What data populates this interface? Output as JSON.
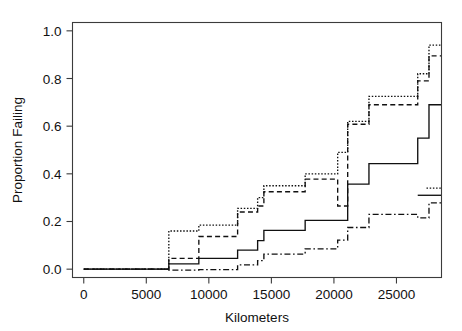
{
  "chart_data": {
    "type": "line",
    "title": "",
    "subtitle": "",
    "xlabel": "Kilometers",
    "ylabel": "Proportion Failing",
    "xlim": [
      -900,
      28600
    ],
    "ylim": [
      -0.035,
      1.035
    ],
    "xticks": [
      0,
      5000,
      10000,
      15000,
      20000,
      25000
    ],
    "xticklabels": [
      "0",
      "5000",
      "10000",
      "15000",
      "20000",
      "25000"
    ],
    "yticks": [
      0.0,
      0.2,
      0.4,
      0.6,
      0.8,
      1.0
    ],
    "yticklabels": [
      "0.0",
      "0.2",
      "0.4",
      "0.6",
      "0.8",
      "1.0"
    ],
    "grid": false,
    "legend": "none",
    "drawstyle": "steps-post",
    "series": [
      {
        "name": "series-1",
        "linestyle": "dotted",
        "x": [
          0,
          6800,
          9200,
          12300,
          13900,
          14400,
          17700,
          20300,
          21100,
          22800,
          26700,
          27600,
          28400
        ],
        "y": [
          0.0,
          0.16,
          0.185,
          0.255,
          0.3,
          0.35,
          0.4,
          0.49,
          0.62,
          0.725,
          0.82,
          0.94,
          0.94
        ]
      },
      {
        "name": "series-2",
        "linestyle": "dashed",
        "x": [
          0,
          6800,
          9200,
          12300,
          13900,
          14400,
          17700,
          20300,
          21100,
          22800,
          26700,
          27600,
          28400
        ],
        "y": [
          0.0,
          0.045,
          0.137,
          0.24,
          0.265,
          0.325,
          0.378,
          0.265,
          0.608,
          0.69,
          0.79,
          0.895,
          0.895
        ]
      },
      {
        "name": "series-3",
        "linestyle": "solid",
        "x": [
          0,
          6800,
          9200,
          12300,
          13900,
          14400,
          17700,
          20300,
          21100,
          22800,
          26700,
          27600,
          28400
        ],
        "y": [
          0.0,
          0.022,
          0.045,
          0.08,
          0.12,
          0.163,
          0.205,
          0.205,
          0.357,
          0.443,
          0.55,
          0.69,
          0.69
        ]
      },
      {
        "name": "series-4",
        "linestyle": "dashdot",
        "x": [
          0,
          6800,
          9200,
          12300,
          13900,
          14400,
          17700,
          20300,
          21100,
          22800,
          26700,
          27600,
          28400
        ],
        "y": [
          0.0,
          -0.004,
          -0.002,
          0.018,
          0.036,
          0.063,
          0.085,
          0.122,
          0.175,
          0.23,
          0.215,
          0.278,
          0.278
        ]
      },
      {
        "name": "series-5",
        "linestyle": "solid",
        "x": [
          26700,
          27600,
          28400
        ],
        "y": [
          0.31,
          0.31,
          0.31
        ]
      },
      {
        "name": "series-6",
        "linestyle": "dotted",
        "x": [
          27400,
          28400
        ],
        "y": [
          0.34,
          0.34
        ]
      }
    ],
    "colors": {
      "line": "#111111",
      "axis": "#3b3b3b",
      "background": "#ffffff"
    }
  }
}
